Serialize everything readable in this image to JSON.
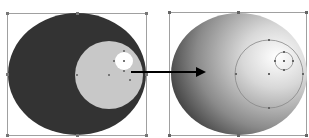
{
  "diagram": {
    "left_figure": {
      "outer_ellipse_color": "#333333",
      "middle_circle_color": "#c8c8c8",
      "highlight_circle_color": "#ffffff",
      "selection_box_color": "#9a9a9a"
    },
    "right_figure": {
      "gradient_stops": [
        "#ffffff",
        "#d8d8d8",
        "#8a8a8a",
        "#3a3a3a"
      ],
      "guide_circle_color": "#888888"
    },
    "arrow": {
      "color": "#000000",
      "direction": "right"
    }
  }
}
